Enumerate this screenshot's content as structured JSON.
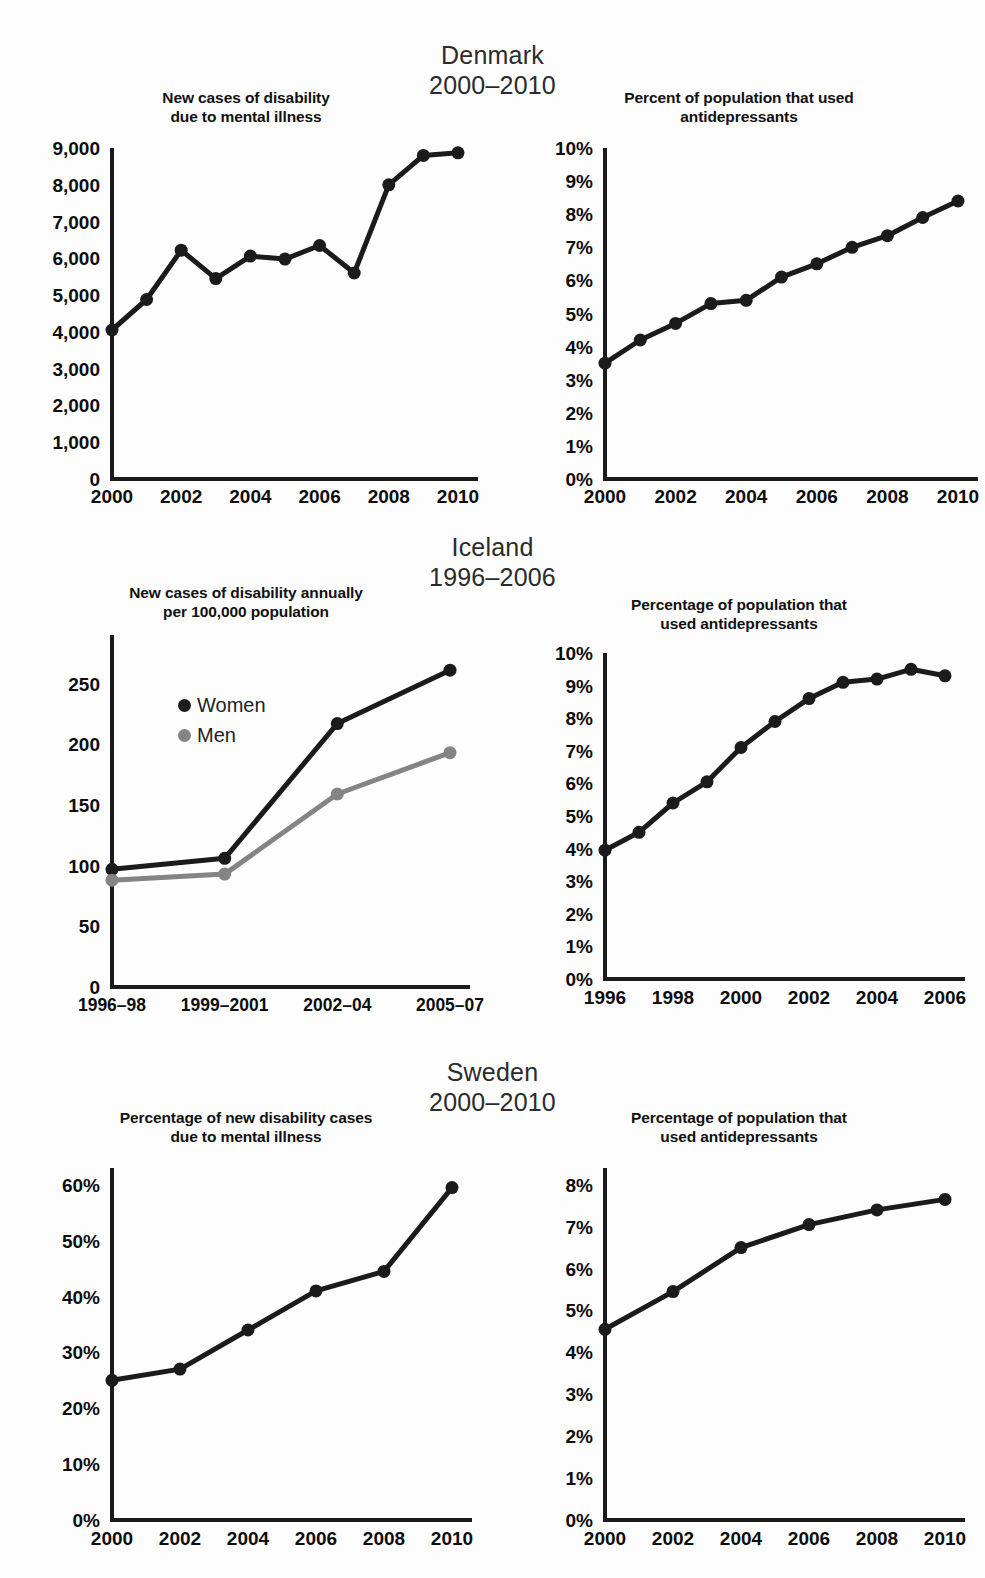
{
  "sections": [
    {
      "country": "Denmark",
      "years": "2000–2010",
      "left": {
        "title_line1": "New cases of disability",
        "title_line2": "due to mental illness"
      },
      "right": {
        "title_line1": "Percent of population that used",
        "title_line2": "antidepressants"
      }
    },
    {
      "country": "Iceland",
      "years": "1996–2006",
      "left": {
        "title_line1": "New cases of disability annually",
        "title_line2": "per 100,000 population"
      },
      "right": {
        "title_line1": "Percentage of population that",
        "title_line2": "used antidepressants"
      }
    },
    {
      "country": "Sweden",
      "years": "2000–2010",
      "left": {
        "title_line1": "Percentage of new disability cases",
        "title_line2": "due to mental illness"
      },
      "right": {
        "title_line1": "Percentage of population that",
        "title_line2": "used antidepressants"
      }
    }
  ],
  "colors": {
    "line_dark": "#1b1b1b",
    "line_gray": "#848484",
    "axis": "#1b1b1b",
    "text": "#111111",
    "background": "#fdfdfd"
  },
  "legend": {
    "items": [
      {
        "label": "Women",
        "color": "#1b1b1b"
      },
      {
        "label": "Men",
        "color": "#848484"
      }
    ]
  },
  "chart_data": [
    {
      "id": "denmark-disability",
      "type": "line",
      "title": "New cases of disability due to mental illness",
      "xlabel": "",
      "ylabel": "",
      "x": [
        2000,
        2001,
        2002,
        2003,
        2004,
        2005,
        2006,
        2007,
        2008,
        2009,
        2010
      ],
      "values": [
        4050,
        4880,
        6220,
        5450,
        6060,
        5980,
        6350,
        5600,
        8000,
        8800,
        8870
      ],
      "ylim": [
        0,
        9000
      ],
      "yticks": [
        0,
        1000,
        2000,
        3000,
        4000,
        5000,
        6000,
        7000,
        8000,
        9000
      ],
      "ytick_labels": [
        "0",
        "1,000",
        "2,000",
        "3,000",
        "4,000",
        "5,000",
        "6,000",
        "7,000",
        "8,000",
        "9,000"
      ],
      "xticks": [
        2000,
        2002,
        2004,
        2006,
        2008,
        2010
      ],
      "xtick_labels": [
        "2000",
        "2002",
        "2004",
        "2006",
        "2008",
        "2010"
      ],
      "grid": false,
      "legend": "none"
    },
    {
      "id": "denmark-antidepressants",
      "type": "line",
      "title": "Percent of population that used antidepressants",
      "xlabel": "",
      "ylabel": "",
      "x": [
        2000,
        2001,
        2002,
        2003,
        2004,
        2005,
        2006,
        2007,
        2008,
        2009,
        2010
      ],
      "values": [
        3.5,
        4.2,
        4.7,
        5.3,
        5.4,
        6.1,
        6.5,
        7.0,
        7.35,
        7.9,
        8.4
      ],
      "ylim": [
        0,
        10
      ],
      "yticks": [
        0,
        1,
        2,
        3,
        4,
        5,
        6,
        7,
        8,
        9,
        10
      ],
      "ytick_labels": [
        "0%",
        "1%",
        "2%",
        "3%",
        "4%",
        "5%",
        "6%",
        "7%",
        "8%",
        "9%",
        "10%"
      ],
      "xticks": [
        2000,
        2002,
        2004,
        2006,
        2008,
        2010
      ],
      "xtick_labels": [
        "2000",
        "2002",
        "2004",
        "2006",
        "2008",
        "2010"
      ],
      "grid": false,
      "legend": "none"
    },
    {
      "id": "iceland-disability",
      "type": "line",
      "title": "New cases of disability annually per 100,000 population",
      "xlabel": "",
      "ylabel": "",
      "categories": [
        "1996–98",
        "1999–2001",
        "2002–04",
        "2005–07"
      ],
      "series": [
        {
          "name": "Women",
          "color": "#1b1b1b",
          "values": [
            97,
            106,
            217,
            261
          ]
        },
        {
          "name": "Men",
          "color": "#848484",
          "values": [
            88,
            93,
            159,
            193
          ]
        }
      ],
      "ylim": [
        0,
        290
      ],
      "yticks": [
        0,
        50,
        100,
        150,
        200,
        250
      ],
      "ytick_labels": [
        "0",
        "50",
        "100",
        "150",
        "200",
        "250"
      ],
      "xtick_labels": [
        "1996–98",
        "1999–2001",
        "2002–04",
        "2005–07"
      ],
      "grid": false,
      "legend": "inside-upper-left"
    },
    {
      "id": "iceland-antidepressants",
      "type": "line",
      "title": "Percentage of population that used antidepressants",
      "xlabel": "",
      "ylabel": "",
      "x": [
        1996,
        1997,
        1998,
        1999,
        2000,
        2001,
        2002,
        2003,
        2004,
        2005,
        2006
      ],
      "values": [
        3.95,
        4.5,
        5.4,
        6.05,
        7.1,
        7.9,
        8.6,
        9.1,
        9.2,
        9.5,
        9.3
      ],
      "ylim": [
        0,
        10
      ],
      "yticks": [
        0,
        1,
        2,
        3,
        4,
        5,
        6,
        7,
        8,
        9,
        10
      ],
      "ytick_labels": [
        "0%",
        "1%",
        "2%",
        "3%",
        "4%",
        "5%",
        "6%",
        "7%",
        "8%",
        "9%",
        "10%"
      ],
      "xticks": [
        1996,
        1998,
        2000,
        2002,
        2004,
        2006
      ],
      "xtick_labels": [
        "1996",
        "1998",
        "2000",
        "2002",
        "2004",
        "2006"
      ],
      "grid": false,
      "legend": "none"
    },
    {
      "id": "sweden-disability",
      "type": "line",
      "title": "Percentage of new disability cases due to mental illness",
      "xlabel": "",
      "ylabel": "",
      "x": [
        2000,
        2002,
        2004,
        2006,
        2008,
        2010
      ],
      "values": [
        25,
        27,
        34,
        41,
        44.5,
        59.5
      ],
      "ylim": [
        0,
        63
      ],
      "yticks": [
        0,
        10,
        20,
        30,
        40,
        50,
        60
      ],
      "ytick_labels": [
        "0%",
        "10%",
        "20%",
        "30%",
        "40%",
        "50%",
        "60%"
      ],
      "xticks": [
        2000,
        2002,
        2004,
        2006,
        2008,
        2010
      ],
      "xtick_labels": [
        "2000",
        "2002",
        "2004",
        "2006",
        "2008",
        "2010"
      ],
      "grid": false,
      "legend": "none"
    },
    {
      "id": "sweden-antidepressants",
      "type": "line",
      "title": "Percentage of population that used antidepressants",
      "xlabel": "",
      "ylabel": "",
      "x": [
        2000,
        2002,
        2004,
        2006,
        2008,
        2010
      ],
      "values": [
        4.55,
        5.45,
        6.5,
        7.05,
        7.4,
        7.65
      ],
      "ylim": [
        0,
        8.4
      ],
      "yticks": [
        0,
        1,
        2,
        3,
        4,
        5,
        6,
        7,
        8
      ],
      "ytick_labels": [
        "0%",
        "1%",
        "2%",
        "3%",
        "4%",
        "5%",
        "6%",
        "7%",
        "8%"
      ],
      "xticks": [
        2000,
        2002,
        2004,
        2006,
        2008,
        2010
      ],
      "xtick_labels": [
        "2000",
        "2002",
        "2004",
        "2006",
        "2008",
        "2010"
      ],
      "grid": false,
      "legend": "none"
    }
  ]
}
